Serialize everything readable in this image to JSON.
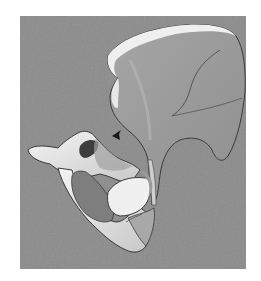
{
  "figure": {
    "background_color": "#8b8b8b",
    "bone_light": "#f2f2f2",
    "bone_mid": "#bdbdbd",
    "bone_shadow": "#6e6e6e",
    "outline": "#3a3a3a",
    "annotations": [
      {
        "type": "arrowhead",
        "x": 117,
        "y": 135,
        "color": "#1a1a1a"
      }
    ],
    "parts": [
      "ilium-wing",
      "iliac-crest",
      "acetabulum-region",
      "pubis",
      "ischium",
      "obturator-foramen",
      "pubic-ramus-tip"
    ]
  }
}
